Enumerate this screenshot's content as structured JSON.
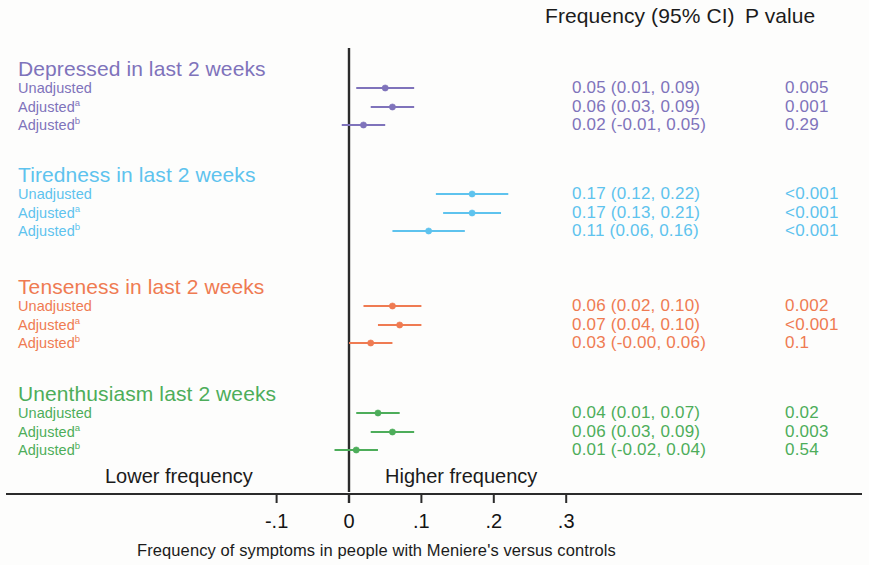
{
  "figure": {
    "type": "forest-plot",
    "columns": {
      "estimate_header": "Frequency (95% CI)",
      "pvalue_header": "P value"
    },
    "axis": {
      "caption": "Frequency of symptoms in people with Meniere's versus controls",
      "left_label": "Lower frequency",
      "right_label": "Higher frequency",
      "tick_labels": [
        "-.1",
        "0",
        ".1",
        ".2",
        ".3"
      ],
      "tick_values": [
        -0.1,
        0,
        0.1,
        0.2,
        0.3
      ],
      "null_line": 0
    },
    "colors": {
      "purple": "#7f73bb",
      "blue": "#5ec3ee",
      "orange": "#ef7b52",
      "green": "#4dad5a",
      "axis": "#2b2b2b",
      "text": "#1b1b1b"
    }
  },
  "chart_data": {
    "type": "forest",
    "title": "",
    "xlabel": "Frequency of symptoms in people with Meniere's versus controls",
    "ylabel": "",
    "xlim": [
      -0.16,
      0.37
    ],
    "xticks": [
      -0.1,
      0,
      0.1,
      0.2,
      0.3
    ],
    "xticklabels": [
      "-.1",
      "0",
      ".1",
      ".2",
      ".3"
    ],
    "reference_line": 0,
    "grid": false,
    "legend": null,
    "groups": [
      {
        "name": "Depressed in last 2 weeks",
        "color": "#7f73bb",
        "rows": [
          {
            "label": "Unadjusted",
            "label_sup": "",
            "estimate": 0.05,
            "ci_low": 0.01,
            "ci_high": 0.09,
            "estimate_text": "0.05 (0.01, 0.09)",
            "p_text": "0.005"
          },
          {
            "label": "Adjusted",
            "label_sup": "a",
            "estimate": 0.06,
            "ci_low": 0.03,
            "ci_high": 0.09,
            "estimate_text": "0.06 (0.03, 0.09)",
            "p_text": "0.001"
          },
          {
            "label": "Adjusted",
            "label_sup": "b",
            "estimate": 0.02,
            "ci_low": -0.01,
            "ci_high": 0.05,
            "estimate_text": "0.02 (-0.01, 0.05)",
            "p_text": "0.29"
          }
        ]
      },
      {
        "name": "Tiredness in last 2 weeks",
        "color": "#5ec3ee",
        "rows": [
          {
            "label": "Unadjusted",
            "label_sup": "",
            "estimate": 0.17,
            "ci_low": 0.12,
            "ci_high": 0.22,
            "estimate_text": "0.17 (0.12, 0.22)",
            "p_text": "<0.001"
          },
          {
            "label": "Adjusted",
            "label_sup": "a",
            "estimate": 0.17,
            "ci_low": 0.13,
            "ci_high": 0.21,
            "estimate_text": "0.17 (0.13, 0.21)",
            "p_text": "<0.001"
          },
          {
            "label": "Adjusted",
            "label_sup": "b",
            "estimate": 0.11,
            "ci_low": 0.06,
            "ci_high": 0.16,
            "estimate_text": "0.11 (0.06, 0.16)",
            "p_text": "<0.001"
          }
        ]
      },
      {
        "name": "Tenseness in last 2 weeks",
        "color": "#ef7b52",
        "rows": [
          {
            "label": "Unadjusted",
            "label_sup": "",
            "estimate": 0.06,
            "ci_low": 0.02,
            "ci_high": 0.1,
            "estimate_text": "0.06 (0.02, 0.10)",
            "p_text": "0.002"
          },
          {
            "label": "Adjusted",
            "label_sup": "a",
            "estimate": 0.07,
            "ci_low": 0.04,
            "ci_high": 0.1,
            "estimate_text": "0.07 (0.04, 0.10)",
            "p_text": "<0.001"
          },
          {
            "label": "Adjusted",
            "label_sup": "b",
            "estimate": 0.03,
            "ci_low": -0.0,
            "ci_high": 0.06,
            "estimate_text": "0.03 (-0.00, 0.06)",
            "p_text": "0.1"
          }
        ]
      },
      {
        "name": "Unenthusiasm last 2 weeks",
        "color": "#4dad5a",
        "rows": [
          {
            "label": "Unadjusted",
            "label_sup": "",
            "estimate": 0.04,
            "ci_low": 0.01,
            "ci_high": 0.07,
            "estimate_text": "0.04 (0.01, 0.07)",
            "p_text": "0.02"
          },
          {
            "label": "Adjusted",
            "label_sup": "a",
            "estimate": 0.06,
            "ci_low": 0.03,
            "ci_high": 0.09,
            "estimate_text": "0.06 (0.03, 0.09)",
            "p_text": "0.003"
          },
          {
            "label": "Adjusted",
            "label_sup": "b",
            "estimate": 0.01,
            "ci_low": -0.02,
            "ci_high": 0.04,
            "estimate_text": "0.01 (-0.02, 0.04)",
            "p_text": "0.54"
          }
        ]
      }
    ]
  }
}
